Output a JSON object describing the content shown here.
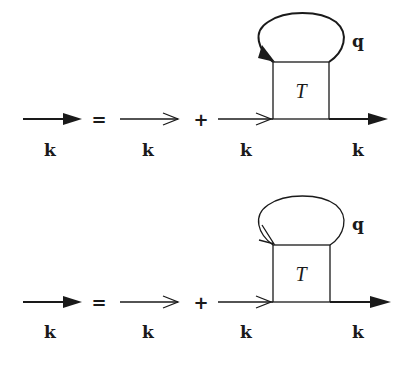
{
  "diagram": {
    "type": "feynman-dyson-equation",
    "colors": {
      "stroke": "#1a1a1a",
      "background": "#ffffff"
    },
    "rows": [
      {
        "id": "equation-1",
        "lhs_label": "k",
        "equals": "=",
        "term1_label": "k",
        "plus": "+",
        "term2_in_label": "k",
        "term2_out_label": "k",
        "vertex_label": "T",
        "loop_label": "q",
        "loop_arrow": "filled"
      },
      {
        "id": "equation-2",
        "lhs_label": "k",
        "equals": "=",
        "term1_label": "k",
        "plus": "+",
        "term2_in_label": "k",
        "term2_out_label": "k",
        "vertex_label": "T",
        "loop_label": "q",
        "loop_arrow": "open"
      }
    ]
  }
}
